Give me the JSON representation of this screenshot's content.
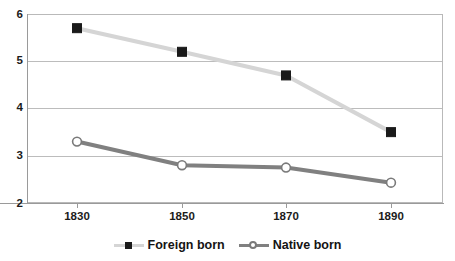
{
  "chart_data": {
    "type": "line",
    "title": "",
    "subtitle": "",
    "xlabel": "",
    "ylabel": "",
    "categories": [
      "1830",
      "1850",
      "1870",
      "1890"
    ],
    "x": [
      1830,
      1850,
      1870,
      1890
    ],
    "xlim": [
      1820,
      1900
    ],
    "ylim": [
      2,
      6
    ],
    "y_ticks": [
      "2",
      "3",
      "4",
      "5",
      "6"
    ],
    "x_ticks": [
      "1830",
      "1850",
      "1870",
      "1890"
    ],
    "grid": true,
    "legend_position": "bottom-center",
    "series": [
      {
        "name": "Foreign born",
        "values": [
          5.7,
          5.2,
          4.7,
          3.5
        ],
        "line_color": "#d5d5d5",
        "marker": "square",
        "marker_fill": "#1a1a1a",
        "marker_edge": "#1a1a1a"
      },
      {
        "name": "Native born",
        "values": [
          3.3,
          2.8,
          2.75,
          2.43
        ],
        "line_color": "#808080",
        "marker": "circle",
        "marker_fill": "#ffffff",
        "marker_edge": "#7a7a7a"
      }
    ]
  },
  "legend": {
    "entries": [
      {
        "label": "Foreign born",
        "marker_icon": "filled-square-marker"
      },
      {
        "label": "Native born",
        "marker_icon": "open-circle-marker"
      }
    ]
  },
  "axes": {
    "y_tick_labels": [
      "6",
      "5",
      "4",
      "3",
      "2"
    ],
    "x_tick_labels": [
      "1830",
      "1850",
      "1870",
      "1890"
    ]
  },
  "colors": {
    "plot_background": "#ffffff",
    "frame_border": "#b9b9b9",
    "gridline": "#bcbcbc",
    "axis_line": "#9a9a9a",
    "tick_text": "#1b1b1b",
    "series_foreign_born": "#d5d5d5",
    "series_native_born": "#808080",
    "marker_foreign_born": "#1a1a1a",
    "marker_native_born": "#ffffff"
  }
}
